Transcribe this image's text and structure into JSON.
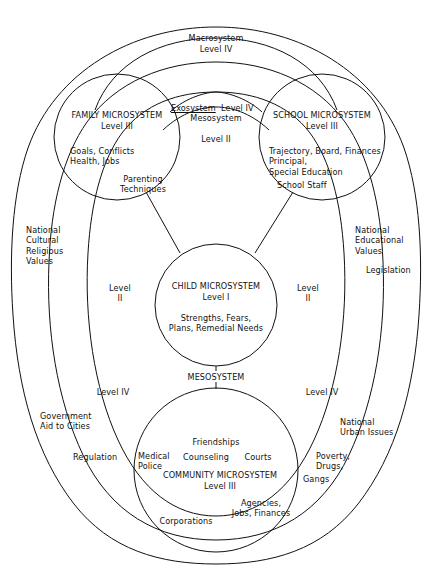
{
  "diagram": {
    "type": "nested-systems-diagram",
    "stroke_color": "#111111",
    "background_color": "#ffffff"
  },
  "macrosystem": {
    "name": "Macrosystem",
    "level": "Level IV"
  },
  "exosystem": {
    "name": "Exosystem",
    "level": "Level IV"
  },
  "mesosystem_top": {
    "name": "Mesosystem",
    "level": "Level II"
  },
  "mesosystem_bottom": {
    "label": "MESOSYSTEM"
  },
  "family": {
    "title": "FAMILY MICROSYSTEM",
    "level": "Level III",
    "items_a": "Goals, Conflicts\nHealth, Jobs",
    "items_b": "Parenting\nTechniques"
  },
  "school": {
    "title": "SCHOOL MICROSYSTEM",
    "level": "Level III",
    "items_a": "Trajectory, Board, Finances\nPrincipal,\nSpecial Education",
    "items_b": "School Staff"
  },
  "child": {
    "title": "CHILD MICROSYSTEM",
    "level": "Level I",
    "items_a": "Strengths, Fears,\nPlans, Remedial Needs"
  },
  "community": {
    "title": "COMMUNITY MICROSYSTEM",
    "level": "Level III",
    "friendships": "Friendships",
    "counseling": "Counseling",
    "courts": "Courts",
    "medical_police": "Medical\nPolice",
    "agencies": "Agencies,\nJobs, Finances",
    "corporations": "Corporations"
  },
  "level_markers": {
    "left_level_ii": "Level\nII",
    "right_level_ii": "Level\nII",
    "left_level_iv": "Level IV",
    "right_level_iv": "Level IV"
  },
  "left_outer": {
    "national_cultural": "National\nCultural\nReligious\nValues",
    "government_aid": "Government\nAid to Cities",
    "regulation": "Regulation"
  },
  "right_outer": {
    "national_educational": "National\nEducational\nValues",
    "legislation": "Legislation",
    "national_urban": "National\nUrban Issues",
    "poverty": "Poverty,\nDrugs,",
    "gangs": "Gangs"
  }
}
